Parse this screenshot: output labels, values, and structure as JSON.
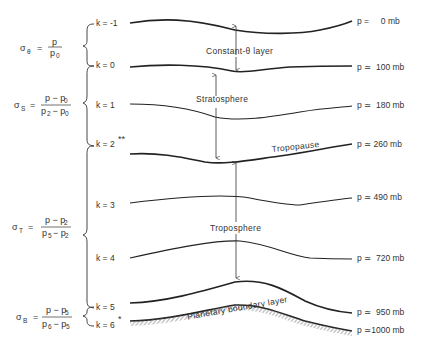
{
  "diagram": {
    "levels": [
      {
        "k_label": "k = -1",
        "pressure_label": "p =     0 mb"
      },
      {
        "k_label": "k = 0",
        "pressure_label": "p ≃  100 mb"
      },
      {
        "k_label": "k = 1",
        "pressure_label": "p ≃  180 mb"
      },
      {
        "k_label": "k = 2",
        "k_mark": "**",
        "pressure_label": "p ≃ 260 mb"
      },
      {
        "k_label": "k = 3",
        "pressure_label": "p ≃ 490 mb"
      },
      {
        "k_label": "k = 4",
        "pressure_label": "p ≃  720 mb"
      },
      {
        "k_label": "k = 5",
        "pressure_label": "p ≃  950 mb"
      },
      {
        "k_label": "k = 6",
        "k_mark": "*",
        "pressure_label": "p ≃1000 mb"
      }
    ],
    "regions": {
      "constant_theta": "Constant-θ  layer",
      "stratosphere": "Stratosphere",
      "tropopause": "Tropopause",
      "troposphere": "Troposphere",
      "pbl": "Planetary boundary layer"
    },
    "sigma_defs": [
      {
        "symbol": "σ",
        "sub": "θ",
        "eq": "=",
        "num": "p",
        "den": "p",
        "den_sub": "0"
      },
      {
        "symbol": "σ",
        "sub": "S",
        "eq": "=",
        "num": "p − p",
        "num_sub": "0",
        "den": "p",
        "den_sub": "2",
        "den2": " − p",
        "den2_sub": "0"
      },
      {
        "symbol": "σ",
        "sub": "T",
        "eq": "=",
        "num": "p − p",
        "num_sub": "2",
        "den": "p",
        "den_sub": "5",
        "den2": "− p",
        "den2_sub": "2"
      },
      {
        "symbol": "σ",
        "sub": "B",
        "eq": "=",
        "num": "p − p",
        "num_sub": "5",
        "den": "p",
        "den_sub": "6",
        "den2": " − p",
        "den2_sub": "5"
      }
    ]
  }
}
